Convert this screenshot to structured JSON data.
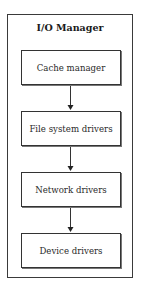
{
  "diagram": {
    "title": "I/O Manager",
    "layers": [
      {
        "label": "Cache manager"
      },
      {
        "label": "File system drivers"
      },
      {
        "label": "Network drivers"
      },
      {
        "label": "Device drivers"
      }
    ],
    "edges": [
      {
        "from": "Cache manager",
        "to": "File system drivers"
      },
      {
        "from": "File system drivers",
        "to": "Network drivers"
      },
      {
        "from": "Network drivers",
        "to": "Device drivers"
      }
    ],
    "colors": {
      "border": "#333333",
      "text": "#222222",
      "background": "#ffffff"
    }
  }
}
